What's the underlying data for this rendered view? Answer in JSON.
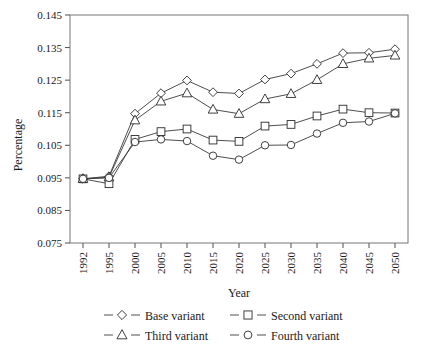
{
  "chart_data": {
    "type": "line",
    "title": "",
    "xlabel": "Year",
    "ylabel": "Percentage",
    "categories": [
      "1992",
      "1995",
      "2000",
      "2005",
      "2010",
      "2015",
      "2020",
      "2025",
      "2030",
      "2035",
      "2040",
      "2045",
      "2050"
    ],
    "yticks": [
      "0.075",
      "0.085",
      "0.095",
      "0.105",
      "0.115",
      "0.125",
      "0.135",
      "0.145"
    ],
    "ylim": [
      0.075,
      0.145
    ],
    "grid": false,
    "legend_position": "bottom",
    "series": [
      {
        "name": "Base variant",
        "marker": "diamond",
        "values": [
          0.0947,
          0.0955,
          0.1147,
          0.121,
          0.1249,
          0.1213,
          0.1209,
          0.1252,
          0.127,
          0.13,
          0.1333,
          0.1334,
          0.1345
        ]
      },
      {
        "name": "Second variant",
        "marker": "square",
        "values": [
          0.0947,
          0.0932,
          0.1068,
          0.1092,
          0.11,
          0.1066,
          0.1062,
          0.1109,
          0.1114,
          0.114,
          0.1161,
          0.115,
          0.1149
        ]
      },
      {
        "name": "Third variant",
        "marker": "triangle",
        "values": [
          0.0947,
          0.0952,
          0.1127,
          0.1185,
          0.121,
          0.116,
          0.1147,
          0.1192,
          0.1208,
          0.1251,
          0.13,
          0.1317,
          0.1326
        ]
      },
      {
        "name": "Fourth variant",
        "marker": "circle",
        "values": [
          0.0947,
          0.095,
          0.106,
          0.1068,
          0.1063,
          0.1018,
          0.1006,
          0.105,
          0.1051,
          0.1086,
          0.1119,
          0.1123,
          0.1148
        ]
      }
    ],
    "colors": {
      "line": "#3a3a3a",
      "marker_fill": "#ffffff",
      "marker_stroke": "#2b2b2b",
      "frame": "#767676",
      "text": "#1a1a1a",
      "background": "#ffffff"
    }
  }
}
